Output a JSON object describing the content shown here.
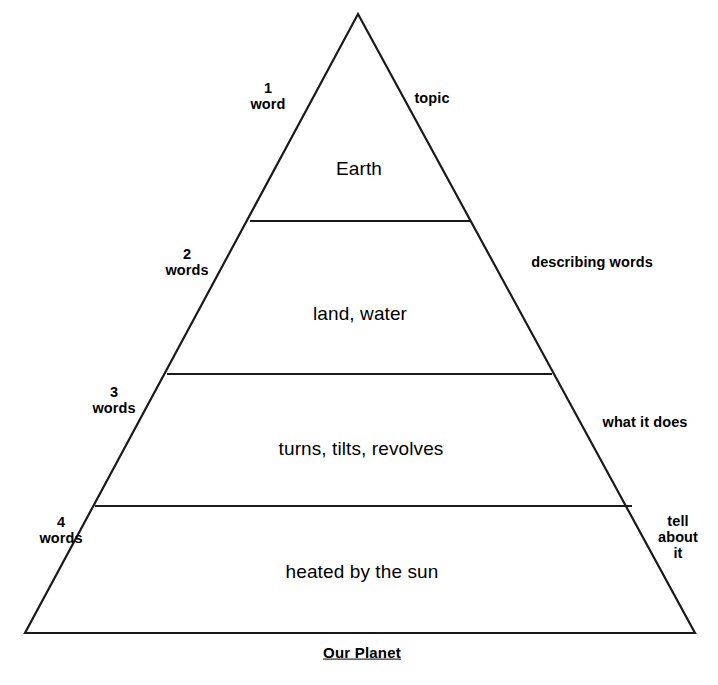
{
  "diagram": {
    "type": "pyramid",
    "title": "Our Planet",
    "caption": "Our Planet",
    "levels": [
      {
        "index": 1,
        "left_label": "1\nword",
        "left_label_lines": [
          "1",
          "word"
        ],
        "right_label": "topic",
        "right_label_lines": [
          "topic"
        ],
        "content": "Earth"
      },
      {
        "index": 2,
        "left_label": "2\nwords",
        "left_label_lines": [
          "2",
          "words"
        ],
        "right_label": "describing words",
        "right_label_lines": [
          "describing words"
        ],
        "content": "land, water"
      },
      {
        "index": 3,
        "left_label": "3\nwords",
        "left_label_lines": [
          "3",
          "words"
        ],
        "right_label": "what it does",
        "right_label_lines": [
          "what it does"
        ],
        "content": "turns, tilts, revolves"
      },
      {
        "index": 4,
        "left_label": "4\nwords",
        "left_label_lines": [
          "4",
          "words"
        ],
        "right_label": "tell\nabout\nit",
        "right_label_lines": [
          "tell",
          "about",
          "it"
        ],
        "content": "heated by the sun"
      }
    ],
    "colors": {
      "stroke": "#1a1a1a",
      "fill": "#ffffff",
      "text": "#000000",
      "background": "#ffffff"
    },
    "geometry": {
      "apex": [
        358,
        14
      ],
      "base_left": [
        25,
        633
      ],
      "base_right": [
        695,
        633
      ],
      "divider_y": [
        221,
        374,
        506
      ]
    }
  }
}
